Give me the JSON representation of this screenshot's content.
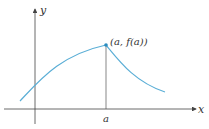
{
  "diagram": {
    "type": "function-graph",
    "axes": {
      "x_label": "x",
      "y_label": "y"
    },
    "point": {
      "label": "(a, f(a))",
      "x_label": "a"
    },
    "colors": {
      "curve": "#5aaed6",
      "axes": "#444444",
      "point": "#2a8cc0"
    }
  }
}
